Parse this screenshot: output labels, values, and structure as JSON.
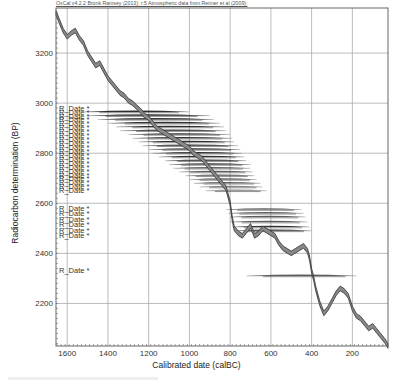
{
  "header": {
    "credit": "OxCal v4.2.2 Bronk Ramsey (2013); r:5 Atmospheric data from Reimer et al (2009);"
  },
  "chart_data": {
    "type": "line",
    "title": "",
    "credit": "OxCal v4.2.2 Bronk Ramsey (2013); r:5 Atmospheric data from Reimer et al (2009);",
    "xlabel": "Calibrated date (calBC)",
    "ylabel": "Radiocarbon determination (BP)",
    "xlim": [
      1655,
      25
    ],
    "ylim": [
      2030,
      3380
    ],
    "x_ticks": [
      1600,
      1400,
      1200,
      1000,
      800,
      600,
      400,
      200
    ],
    "y_ticks": [
      2200,
      2400,
      2600,
      2800,
      3000,
      3200
    ],
    "grid": true,
    "series": [
      {
        "name": "IntCal09 calibration curve",
        "style": "band",
        "x": [
          1655,
          1640,
          1620,
          1600,
          1580,
          1560,
          1540,
          1520,
          1500,
          1480,
          1460,
          1440,
          1420,
          1400,
          1380,
          1360,
          1340,
          1320,
          1300,
          1280,
          1260,
          1240,
          1220,
          1200,
          1180,
          1160,
          1140,
          1120,
          1100,
          1080,
          1060,
          1040,
          1020,
          1000,
          980,
          960,
          940,
          920,
          900,
          880,
          860,
          840,
          820,
          800,
          790,
          780,
          760,
          740,
          720,
          700,
          680,
          660,
          640,
          620,
          600,
          580,
          560,
          540,
          520,
          500,
          480,
          460,
          440,
          420,
          410,
          400,
          390,
          380,
          360,
          340,
          320,
          300,
          280,
          260,
          240,
          220,
          200,
          180,
          160,
          140,
          120,
          100,
          80,
          60,
          40,
          25
        ],
        "y": [
          3360,
          3330,
          3290,
          3265,
          3280,
          3290,
          3260,
          3240,
          3200,
          3175,
          3150,
          3160,
          3130,
          3100,
          3080,
          3060,
          3040,
          3030,
          3010,
          3000,
          2985,
          2970,
          2950,
          2940,
          2920,
          2900,
          2890,
          2880,
          2870,
          2860,
          2850,
          2840,
          2830,
          2820,
          2800,
          2790,
          2780,
          2760,
          2740,
          2720,
          2700,
          2680,
          2660,
          2600,
          2540,
          2500,
          2480,
          2470,
          2490,
          2510,
          2470,
          2480,
          2500,
          2490,
          2480,
          2470,
          2440,
          2420,
          2410,
          2400,
          2410,
          2420,
          2430,
          2410,
          2380,
          2330,
          2300,
          2260,
          2200,
          2160,
          2180,
          2210,
          2240,
          2260,
          2250,
          2230,
          2180,
          2150,
          2140,
          2120,
          2100,
          2110,
          2090,
          2070,
          2050,
          2030
        ]
      }
    ],
    "r_date_labels": {
      "label": "R_Date",
      "count_upper_cluster": 22,
      "count_lower_cluster": 6,
      "count_single": 1,
      "upper_cluster_y_range": [
        2650,
        2980
      ],
      "lower_cluster_y_range": [
        2470,
        2580
      ],
      "single_y": 2330
    },
    "distributions": [
      {
        "y": 2965,
        "x_from": 1520,
        "x_to": 1000,
        "density": "dark"
      },
      {
        "y": 2950,
        "x_from": 1500,
        "x_to": 900,
        "density": "dark"
      },
      {
        "y": 2935,
        "x_from": 1450,
        "x_to": 880,
        "density": "dark"
      },
      {
        "y": 2920,
        "x_from": 1400,
        "x_to": 850,
        "density": "dark"
      },
      {
        "y": 2905,
        "x_from": 1360,
        "x_to": 830,
        "density": "dark"
      },
      {
        "y": 2890,
        "x_from": 1340,
        "x_to": 820,
        "density": "dark"
      },
      {
        "y": 2875,
        "x_from": 1300,
        "x_to": 800,
        "density": "dark"
      },
      {
        "y": 2860,
        "x_from": 1280,
        "x_to": 790,
        "density": "dark"
      },
      {
        "y": 2845,
        "x_from": 1250,
        "x_to": 780,
        "density": "dark"
      },
      {
        "y": 2830,
        "x_from": 1230,
        "x_to": 760,
        "density": "dark"
      },
      {
        "y": 2815,
        "x_from": 1200,
        "x_to": 750,
        "density": "dark"
      },
      {
        "y": 2800,
        "x_from": 1180,
        "x_to": 740,
        "density": "dark"
      },
      {
        "y": 2785,
        "x_from": 1150,
        "x_to": 730,
        "density": "dark"
      },
      {
        "y": 2770,
        "x_from": 1120,
        "x_to": 720,
        "density": "dark"
      },
      {
        "y": 2755,
        "x_from": 1100,
        "x_to": 700,
        "density": "dark"
      },
      {
        "y": 2740,
        "x_from": 1080,
        "x_to": 700,
        "density": "medium"
      },
      {
        "y": 2725,
        "x_from": 1050,
        "x_to": 690,
        "density": "medium"
      },
      {
        "y": 2710,
        "x_from": 1020,
        "x_to": 680,
        "density": "medium"
      },
      {
        "y": 2695,
        "x_from": 1000,
        "x_to": 670,
        "density": "medium"
      },
      {
        "y": 2680,
        "x_from": 980,
        "x_to": 650,
        "density": "medium"
      },
      {
        "y": 2665,
        "x_from": 950,
        "x_to": 640,
        "density": "light"
      },
      {
        "y": 2650,
        "x_from": 920,
        "x_to": 620,
        "density": "light"
      },
      {
        "y": 2575,
        "x_from": 820,
        "x_to": 450,
        "density": "medium"
      },
      {
        "y": 2560,
        "x_from": 810,
        "x_to": 440,
        "density": "medium"
      },
      {
        "y": 2545,
        "x_from": 800,
        "x_to": 430,
        "density": "medium"
      },
      {
        "y": 2525,
        "x_from": 800,
        "x_to": 420,
        "density": "medium"
      },
      {
        "y": 2505,
        "x_from": 790,
        "x_to": 410,
        "density": "dark"
      },
      {
        "y": 2490,
        "x_from": 780,
        "x_to": 400,
        "density": "dark"
      },
      {
        "y": 2310,
        "x_from": 720,
        "x_to": 180,
        "density": "medium"
      }
    ]
  }
}
